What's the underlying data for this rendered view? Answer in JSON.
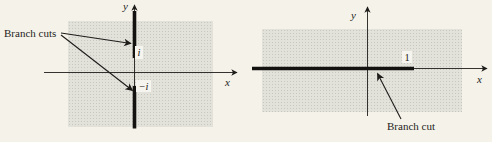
{
  "palette": {
    "page_bg": "#f5f2ea",
    "ink": "#1f1d1a",
    "shade_bg": "#e2e1da",
    "shade_dot": "#c7c6bf",
    "label_box_bg": "#f6f4ee"
  },
  "left_figure": {
    "caption": "Branch cuts",
    "y_axis_label": "y",
    "x_axis_label": "x",
    "upper_point_label": "i",
    "lower_point_label": "−i"
  },
  "right_figure": {
    "caption": "Branch cut",
    "y_axis_label": "y",
    "x_axis_label": "x",
    "point_label": "1"
  }
}
